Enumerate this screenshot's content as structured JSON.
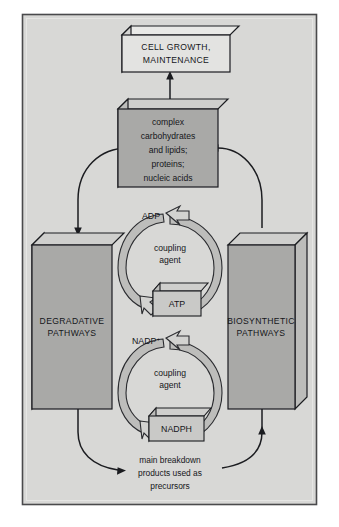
{
  "figure": {
    "panel": {
      "background_color": "#d8d8d6",
      "border_color": "#4a4a4c",
      "outer_background": "#ffffff"
    },
    "palette": {
      "box_fill_light": "#e3e3e1",
      "box_fill_gray": "#a9a9a7",
      "box_top_face": "#cfcfcd",
      "box_side_face": "#bcbcba",
      "ribbon_fill": "#bdbdbb",
      "line_color": "#1b1c20",
      "text_color": "#15161a"
    },
    "nodes": {
      "cell_growth": {
        "lines": [
          "CELL GROWTH,",
          "MAINTENANCE"
        ],
        "style": "light"
      },
      "macromolecules": {
        "lines": [
          "complex",
          "carbohydrates",
          "and lipids;",
          "proteins;",
          "nucleic acids"
        ],
        "style": "gray"
      },
      "degradative": {
        "lines": [
          "DEGRADATIVE",
          "PATHWAYS"
        ],
        "style": "gray"
      },
      "biosynthetic": {
        "lines": [
          "BIOSYNTHETIC",
          "PATHWAYS"
        ],
        "style": "gray"
      },
      "atp": {
        "label": "ATP"
      },
      "adp": {
        "label": "ADP"
      },
      "nadph": {
        "label": "NADPH"
      },
      "nadp": {
        "label": "NADP",
        "superscript": "+"
      }
    },
    "cycles": [
      {
        "id": "atp-cycle",
        "center_lines": [
          "coupling",
          "agent"
        ]
      },
      {
        "id": "nadph-cycle",
        "center_lines": [
          "coupling",
          "agent"
        ]
      }
    ],
    "caption": {
      "lines": [
        "main breakdown",
        "products used as",
        "precursors"
      ]
    }
  }
}
